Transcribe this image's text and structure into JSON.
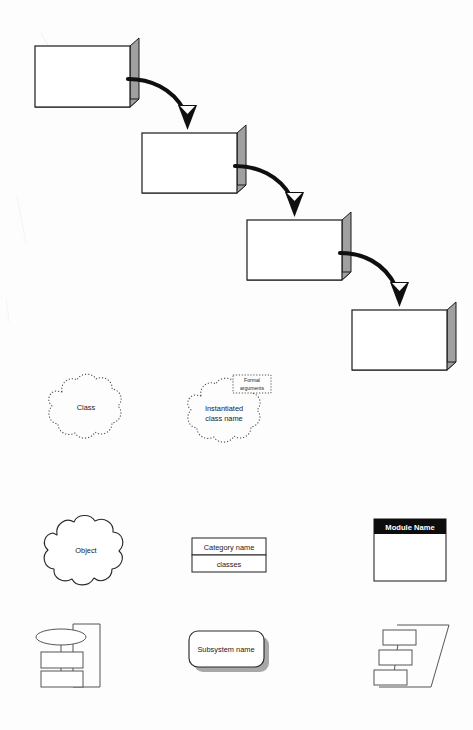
{
  "page": {
    "background_color": "#fdfdfd",
    "width": 473,
    "height": 730
  },
  "colors": {
    "ink": "#1a1a1a",
    "extrusion_gray": "#a0a0a0",
    "extrusion_gray_dark": "#909090",
    "shadow_gray": "#a8a8a8",
    "module_header_fill": "#0d0d0d",
    "module_header_text": "#ffffff",
    "dashed_outline": "#4a4a4a",
    "shape_outline": "#2b2b2b"
  },
  "cascade": {
    "name": "three-d-box-cascade",
    "box_count": 4,
    "boxes": [
      {
        "index": 1,
        "label": "",
        "x": 35,
        "y": 46,
        "width": 95,
        "height": 61,
        "depth": 9
      },
      {
        "index": 2,
        "label": "",
        "x": 142,
        "y": 133,
        "width": 95,
        "height": 60,
        "depth": 9
      },
      {
        "index": 3,
        "label": "",
        "x": 247,
        "y": 220,
        "width": 95,
        "height": 60,
        "depth": 9
      },
      {
        "index": 4,
        "label": "",
        "x": 352,
        "y": 310,
        "width": 95,
        "height": 60,
        "depth": 9
      }
    ],
    "arrows": [
      {
        "index": 1,
        "from_box": 1,
        "to_box": 2
      },
      {
        "index": 2,
        "from_box": 2,
        "to_box": 3
      },
      {
        "index": 3,
        "from_box": 3,
        "to_box": 4
      }
    ]
  },
  "symbols": {
    "class_cloud": {
      "name": "class-cloud",
      "label": "Class",
      "outline_style": "dashed"
    },
    "instantiated_class_cloud": {
      "name": "instantiated-class-cloud",
      "label_line1": "Instantiated",
      "label_line2": "class name",
      "outline_style": "dashed",
      "formal_arguments_box": {
        "name": "formal-arguments-box",
        "label_line1": "Formal",
        "label_line2": "arguments",
        "outline_style": "dashed"
      }
    },
    "object_cloud": {
      "name": "object-cloud",
      "label": "Object",
      "outline_style": "solid"
    },
    "category_table": {
      "name": "class-category-box",
      "rows": [
        {
          "label": "Category name"
        },
        {
          "label": "classes"
        }
      ]
    },
    "module": {
      "name": "module-box",
      "header_label": "Module Name",
      "body_label": ""
    },
    "process_stack": {
      "name": "process-diagram-symbol",
      "parts": [
        "ellipse",
        "rectangle",
        "rectangle",
        "enclosing-rectangle"
      ]
    },
    "subsystem": {
      "name": "subsystem-box",
      "label": "Subsystem name",
      "has_shadow": true
    },
    "processor_stack": {
      "name": "processor-diagram-symbol",
      "parts": [
        "slanted-outline",
        "box",
        "box",
        "box"
      ]
    }
  }
}
